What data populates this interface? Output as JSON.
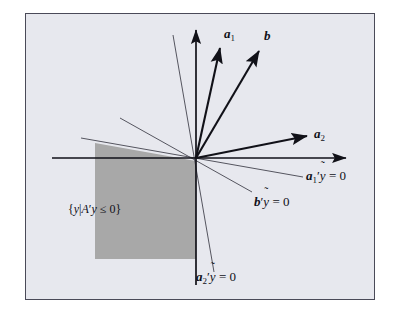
{
  "figure": {
    "kind": "polar-cone-diagram",
    "background_color": "#e7e8ee",
    "page_color": "#ffffff",
    "border_color": "#4a4a58",
    "shaded_region_color": "#a8a8a8",
    "axis_color": "#111118",
    "vector_color": "#111118",
    "hyperplane_color": "#55555f"
  },
  "labels": {
    "a1": {
      "name": "a",
      "sub": "1"
    },
    "b": {
      "name": "b",
      "sub": ""
    },
    "a2": {
      "name": "a",
      "sub": "2"
    },
    "a1_hyperplane": {
      "name": "a",
      "sub": "1",
      "prime": "′",
      "var": "y",
      "rhs": "= 0"
    },
    "b_hyperplane": {
      "name": "b",
      "sub": "",
      "prime": "′",
      "var": "y",
      "rhs": "= 0"
    },
    "a2_hyperplane": {
      "name": "a",
      "sub": "2",
      "prime": "′",
      "var": "y",
      "rhs": "= 0"
    },
    "cone_set": {
      "open": "{",
      "y": "y",
      "bar": "|",
      "A": "A",
      "prime": "′",
      "y2": "y",
      "rel": "≤ 0",
      "close": "}"
    },
    "tilde": "˜"
  },
  "geometry": {
    "origin": {
      "x": 196,
      "y": 158
    },
    "axes": {
      "vertical": {
        "x1": 196,
        "y1": 285,
        "x2": 196,
        "y2": 28
      },
      "horizontal": {
        "x1": 52,
        "y1": 158,
        "x2": 348,
        "y2": 158
      }
    },
    "vectors": [
      {
        "id": "a1",
        "x1": 196,
        "y1": 158,
        "x2": 221,
        "y2": 45
      },
      {
        "id": "b",
        "x1": 196,
        "y1": 158,
        "x2": 261,
        "y2": 48
      },
      {
        "id": "a2",
        "x1": 196,
        "y1": 158,
        "x2": 310,
        "y2": 135
      }
    ],
    "hyperplanes": [
      {
        "id": "a1_line",
        "x1": 81,
        "y1": 138,
        "x2": 303,
        "y2": 177
      },
      {
        "id": "b_line",
        "x1": 120,
        "y1": 118,
        "x2": 252,
        "y2": 192
      },
      {
        "id": "a2_line",
        "x1": 173,
        "y1": 35,
        "x2": 214,
        "y2": 272
      }
    ],
    "shaded_polygon": "95,143 196,161 196,259 95,259"
  }
}
